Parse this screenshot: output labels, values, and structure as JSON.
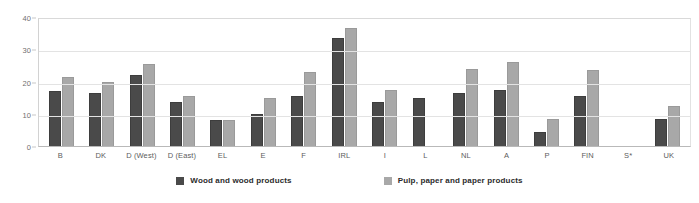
{
  "chart_data": {
    "type": "bar",
    "title": "",
    "subtitle": "",
    "xlabel": "",
    "ylabel": "",
    "ylim": [
      0,
      40
    ],
    "yticks": [
      0,
      10,
      20,
      30,
      40
    ],
    "ytick_labels": [
      "0",
      "10",
      "20",
      "30",
      "40"
    ],
    "grid": true,
    "legend_position": "bottom",
    "categories": [
      "B",
      "DK",
      "D (West)",
      "D (East)",
      "EL",
      "E",
      "F",
      "IRL",
      "I",
      "L",
      "NL",
      "A",
      "P",
      "FIN",
      "S*",
      "UK"
    ],
    "series": [
      {
        "name": "Wood and wood products",
        "color": "#4a4a4a",
        "values": [
          17,
          16.5,
          22,
          13.5,
          8,
          10,
          15.5,
          33.5,
          13.5,
          15,
          16.5,
          17.5,
          4.5,
          15.5,
          null,
          8.5
        ]
      },
      {
        "name": "Pulp, paper and paper products",
        "color": "#a8a8a8",
        "values": [
          21.5,
          20,
          25.5,
          15.5,
          8,
          15,
          23,
          36.5,
          17.5,
          null,
          24,
          26,
          8.5,
          23.5,
          null,
          12.5
        ]
      }
    ]
  },
  "legend": {
    "items": [
      {
        "label": "Wood and wood products",
        "swatch": "dark"
      },
      {
        "label": "Pulp, paper and paper products",
        "swatch": "light"
      }
    ]
  },
  "colors": {
    "series_dark": "#4a4a4a",
    "series_light": "#a8a8a8",
    "gridline": "#e3e3e3",
    "axis": "#b9b9b9",
    "tick_text": "#6f6f6f",
    "background": "#ffffff"
  }
}
